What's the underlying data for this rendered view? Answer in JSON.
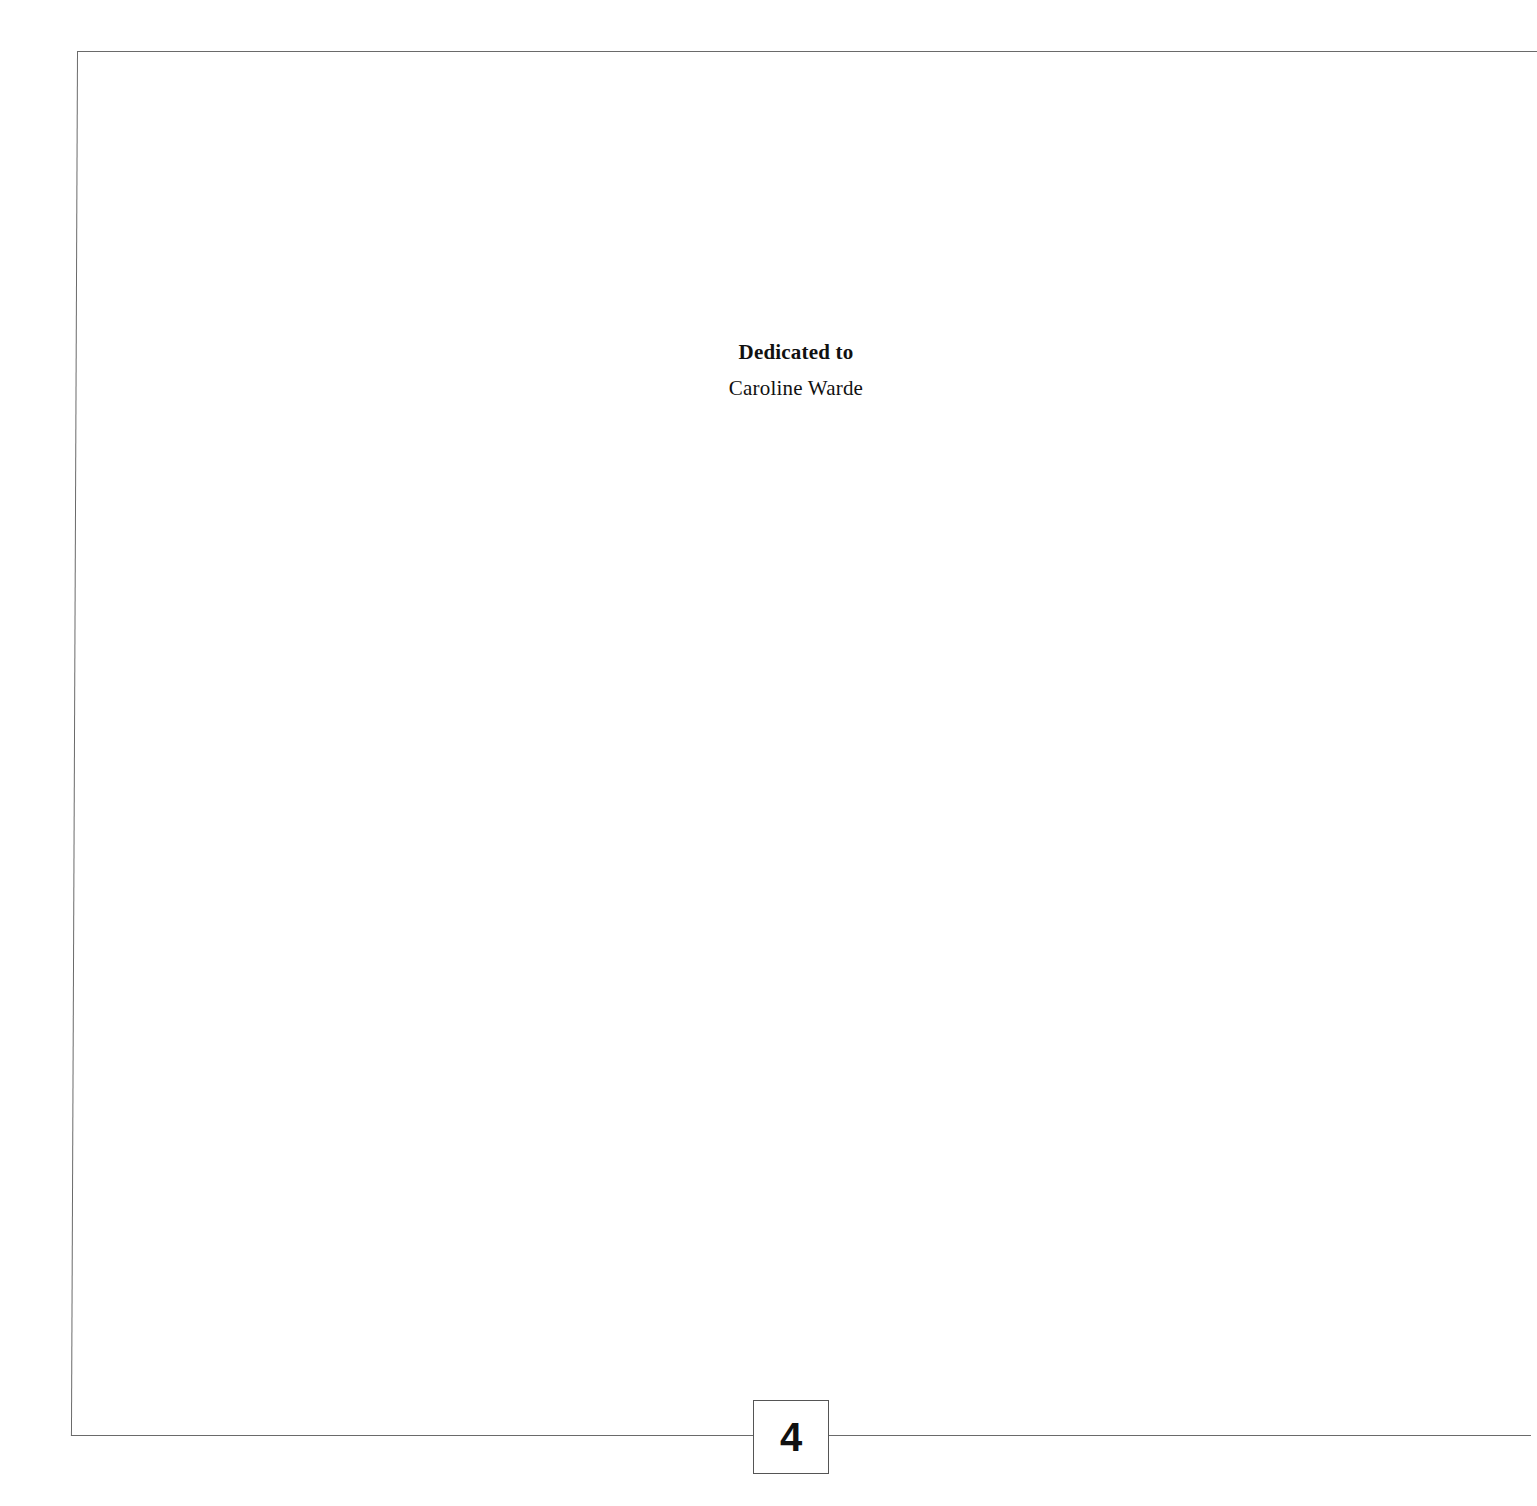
{
  "document": {
    "dedication": {
      "heading": "Dedicated to",
      "name": "Caroline Warde"
    },
    "page_number": "4"
  },
  "colors": {
    "background": "#ffffff",
    "frame_line": "#6a6a6a",
    "text": "#111111"
  }
}
